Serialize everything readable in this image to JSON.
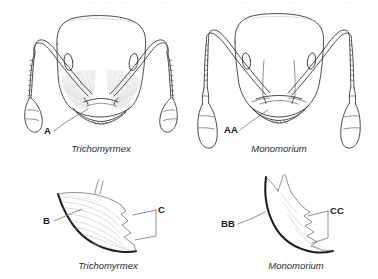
{
  "figure": {
    "type": "scientific-illustration-plate",
    "background_color": "#ffffff",
    "ink_color": "#3a3a3e",
    "heavy_ink_color": "#1d1d20"
  },
  "panels": [
    {
      "id": "top-left",
      "view": "full-face head view",
      "genus_label": "Trichomyrmex",
      "callouts": [
        {
          "id": "A",
          "label": "A",
          "points_to": "ventral head margin with dense erect setae (psammophore)"
        }
      ]
    },
    {
      "id": "top-right",
      "view": "full-face head view",
      "genus_label": "Monomorium",
      "callouts": [
        {
          "id": "AA",
          "label": "AA",
          "points_to": "ventral head margin lacking dense setae"
        }
      ]
    },
    {
      "id": "bottom-left",
      "view": "mandible detail",
      "genus_label": "Trichomyrmex",
      "callouts": [
        {
          "id": "B",
          "label": "B",
          "points_to": "thickened outer mandibular margin"
        },
        {
          "id": "C",
          "label": "C",
          "points_to": "masticatory margin teeth"
        }
      ]
    },
    {
      "id": "bottom-right",
      "view": "mandible detail",
      "genus_label": "Monomorium",
      "callouts": [
        {
          "id": "BB",
          "label": "BB",
          "points_to": "thickened outer mandibular margin"
        },
        {
          "id": "CC",
          "label": "CC",
          "points_to": "masticatory margin teeth"
        }
      ]
    }
  ],
  "labels": {
    "a": "A",
    "aa": "AA",
    "b": "B",
    "bb": "BB",
    "c": "C",
    "cc": "CC",
    "genus_left_top": "Trichomyrmex",
    "genus_right_top": "Monomorium",
    "genus_left_bottom": "Trichomyrmex",
    "genus_right_bottom": "Monomorium"
  }
}
